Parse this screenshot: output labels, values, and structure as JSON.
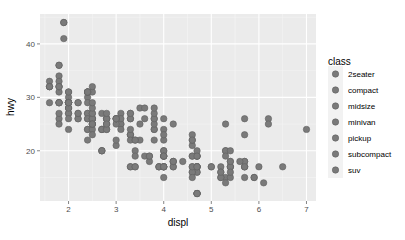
{
  "chart_data": {
    "type": "scatter",
    "title": "",
    "xlabel": "displ",
    "ylabel": "hwy",
    "xlim": [
      1.4,
      7.2
    ],
    "ylim": [
      10.6,
      45.6
    ],
    "x_ticks": [
      2,
      3,
      4,
      5,
      6,
      7
    ],
    "y_ticks": [
      20,
      30,
      40
    ],
    "grid": true,
    "legend_position": "right",
    "legend": {
      "title": "class",
      "entries": [
        "2seater",
        "compact",
        "midsize",
        "minivan",
        "pickup",
        "subcompact",
        "suv"
      ]
    },
    "point_color": "#7a7a7a",
    "points": [
      [
        1.8,
        29
      ],
      [
        1.8,
        29
      ],
      [
        2.0,
        31
      ],
      [
        2.0,
        30
      ],
      [
        2.8,
        26
      ],
      [
        2.8,
        26
      ],
      [
        3.1,
        27
      ],
      [
        1.8,
        26
      ],
      [
        1.8,
        25
      ],
      [
        2.0,
        28
      ],
      [
        2.0,
        27
      ],
      [
        2.8,
        25
      ],
      [
        2.8,
        25
      ],
      [
        3.1,
        25
      ],
      [
        3.1,
        25
      ],
      [
        4.2,
        25
      ],
      [
        5.3,
        20
      ],
      [
        5.3,
        15
      ],
      [
        5.3,
        20
      ],
      [
        5.7,
        17
      ],
      [
        6.0,
        17
      ],
      [
        5.7,
        26
      ],
      [
        5.7,
        23
      ],
      [
        6.2,
        26
      ],
      [
        6.2,
        25
      ],
      [
        7.0,
        24
      ],
      [
        5.3,
        19
      ],
      [
        5.3,
        14
      ],
      [
        5.7,
        15
      ],
      [
        6.5,
        17
      ],
      [
        2.4,
        24
      ],
      [
        2.4,
        24
      ],
      [
        3.1,
        24
      ],
      [
        3.5,
        22
      ],
      [
        3.6,
        19
      ],
      [
        2.4,
        22
      ],
      [
        3.0,
        21
      ],
      [
        3.3,
        23
      ],
      [
        3.3,
        23
      ],
      [
        3.3,
        23
      ],
      [
        3.3,
        24
      ],
      [
        3.3,
        22
      ],
      [
        3.8,
        22
      ],
      [
        3.8,
        24
      ],
      [
        3.8,
        24
      ],
      [
        4.0,
        22
      ],
      [
        3.7,
        19
      ],
      [
        3.7,
        18
      ],
      [
        3.9,
        17
      ],
      [
        3.9,
        17
      ],
      [
        4.7,
        19
      ],
      [
        4.7,
        19
      ],
      [
        4.7,
        12
      ],
      [
        5.2,
        17
      ],
      [
        5.2,
        15
      ],
      [
        3.9,
        17
      ],
      [
        4.7,
        17
      ],
      [
        4.7,
        12
      ],
      [
        4.7,
        17
      ],
      [
        5.2,
        16
      ],
      [
        5.7,
        18
      ],
      [
        5.9,
        15
      ],
      [
        4.7,
        16
      ],
      [
        4.7,
        12
      ],
      [
        4.7,
        17
      ],
      [
        4.7,
        17
      ],
      [
        4.7,
        16
      ],
      [
        4.7,
        12
      ],
      [
        5.2,
        15
      ],
      [
        5.2,
        16
      ],
      [
        5.7,
        17
      ],
      [
        5.9,
        15
      ],
      [
        4.6,
        17
      ],
      [
        5.4,
        17
      ],
      [
        5.4,
        18
      ],
      [
        4.0,
        17
      ],
      [
        4.0,
        19
      ],
      [
        4.0,
        17
      ],
      [
        4.0,
        19
      ],
      [
        4.6,
        19
      ],
      [
        5.0,
        17
      ],
      [
        4.2,
        17
      ],
      [
        4.2,
        17
      ],
      [
        4.6,
        16
      ],
      [
        4.6,
        16
      ],
      [
        4.6,
        17
      ],
      [
        5.4,
        15
      ],
      [
        5.4,
        17
      ],
      [
        3.8,
        26
      ],
      [
        3.8,
        25
      ],
      [
        4.0,
        26
      ],
      [
        4.0,
        24
      ],
      [
        4.6,
        21
      ],
      [
        4.6,
        22
      ],
      [
        4.6,
        23
      ],
      [
        4.6,
        22
      ],
      [
        5.4,
        20
      ],
      [
        1.6,
        33
      ],
      [
        1.6,
        32
      ],
      [
        1.6,
        32
      ],
      [
        1.6,
        29
      ],
      [
        1.6,
        32
      ],
      [
        1.8,
        34
      ],
      [
        1.8,
        36
      ],
      [
        1.8,
        36
      ],
      [
        2.0,
        29
      ],
      [
        2.4,
        26
      ],
      [
        2.4,
        27
      ],
      [
        2.4,
        30
      ],
      [
        2.4,
        31
      ],
      [
        2.5,
        26
      ],
      [
        2.5,
        26
      ],
      [
        3.3,
        26
      ],
      [
        2.0,
        29
      ],
      [
        2.0,
        28
      ],
      [
        2.0,
        27
      ],
      [
        2.0,
        24
      ],
      [
        2.7,
        24
      ],
      [
        2.7,
        24
      ],
      [
        2.7,
        24
      ],
      [
        3.0,
        22
      ],
      [
        3.7,
        19
      ],
      [
        4.0,
        20
      ],
      [
        4.7,
        17
      ],
      [
        4.7,
        12
      ],
      [
        4.7,
        19
      ],
      [
        5.7,
        18
      ],
      [
        6.1,
        14
      ],
      [
        4.0,
        15
      ],
      [
        4.2,
        18
      ],
      [
        4.4,
        18
      ],
      [
        4.6,
        15
      ],
      [
        5.4,
        17
      ],
      [
        5.4,
        16
      ],
      [
        5.4,
        18
      ],
      [
        4.0,
        17
      ],
      [
        4.0,
        19
      ],
      [
        4.6,
        19
      ],
      [
        5.0,
        17
      ],
      [
        2.4,
        29
      ],
      [
        2.4,
        27
      ],
      [
        2.5,
        31
      ],
      [
        2.5,
        32
      ],
      [
        3.3,
        27
      ],
      [
        3.3,
        26
      ],
      [
        2.4,
        26
      ],
      [
        3.0,
        25
      ],
      [
        3.5,
        25
      ],
      [
        3.3,
        17
      ],
      [
        3.3,
        17
      ],
      [
        4.0,
        20
      ],
      [
        5.6,
        18
      ],
      [
        3.1,
        26
      ],
      [
        3.8,
        26
      ],
      [
        3.8,
        27
      ],
      [
        3.8,
        28
      ],
      [
        5.3,
        25
      ],
      [
        2.5,
        25
      ],
      [
        2.5,
        24
      ],
      [
        2.5,
        27
      ],
      [
        2.5,
        25
      ],
      [
        2.5,
        26
      ],
      [
        2.5,
        23
      ],
      [
        2.2,
        26
      ],
      [
        2.2,
        26
      ],
      [
        2.5,
        26
      ],
      [
        2.5,
        26
      ],
      [
        2.5,
        25
      ],
      [
        2.5,
        27
      ],
      [
        2.5,
        25
      ],
      [
        2.7,
        27
      ],
      [
        2.7,
        20
      ],
      [
        3.4,
        20
      ],
      [
        3.4,
        19
      ],
      [
        4.0,
        17
      ],
      [
        4.7,
        20
      ],
      [
        2.2,
        27
      ],
      [
        2.2,
        29
      ],
      [
        2.4,
        31
      ],
      [
        2.4,
        31
      ],
      [
        3.0,
        26
      ],
      [
        3.0,
        26
      ],
      [
        3.5,
        28
      ],
      [
        2.2,
        27
      ],
      [
        2.2,
        29
      ],
      [
        2.4,
        31
      ],
      [
        2.4,
        31
      ],
      [
        3.0,
        26
      ],
      [
        3.0,
        26
      ],
      [
        3.3,
        27
      ],
      [
        1.8,
        31
      ],
      [
        1.8,
        32
      ],
      [
        1.8,
        27
      ],
      [
        1.8,
        33
      ],
      [
        1.8,
        32
      ],
      [
        1.8,
        32
      ],
      [
        1.9,
        44
      ],
      [
        1.9,
        41
      ],
      [
        2.0,
        29
      ],
      [
        2.0,
        26
      ],
      [
        2.5,
        28
      ],
      [
        2.5,
        29
      ],
      [
        2.0,
        29
      ],
      [
        2.0,
        29
      ],
      [
        2.8,
        24
      ],
      [
        2.8,
        24
      ],
      [
        1.9,
        44
      ],
      [
        2.0,
        29
      ],
      [
        2.0,
        29
      ],
      [
        2.0,
        28
      ],
      [
        2.0,
        29
      ],
      [
        2.8,
        26
      ],
      [
        2.8,
        26
      ],
      [
        3.6,
        26
      ],
      [
        1.8,
        29
      ],
      [
        1.8,
        29
      ],
      [
        2.0,
        31
      ],
      [
        2.0,
        29
      ],
      [
        2.8,
        27
      ],
      [
        2.8,
        25
      ],
      [
        3.6,
        28
      ],
      [
        2.7,
        20
      ],
      [
        2.7,
        20
      ],
      [
        3.4,
        17
      ],
      [
        3.4,
        17
      ],
      [
        4.0,
        19
      ],
      [
        4.7,
        17
      ],
      [
        4.2,
        18
      ],
      [
        4.2,
        18
      ],
      [
        4.0,
        17
      ],
      [
        4.0,
        19
      ],
      [
        3.4,
        22
      ],
      [
        3.4,
        22
      ],
      [
        4.0,
        23
      ],
      [
        4.7,
        19
      ],
      [
        5.7,
        17
      ]
    ]
  },
  "legend_title": "class",
  "legend_labels": [
    "2seater",
    "compact",
    "midsize",
    "minivan",
    "pickup",
    "subcompact",
    "suv"
  ],
  "axis": {
    "x_title": "displ",
    "y_title": "hwy"
  }
}
